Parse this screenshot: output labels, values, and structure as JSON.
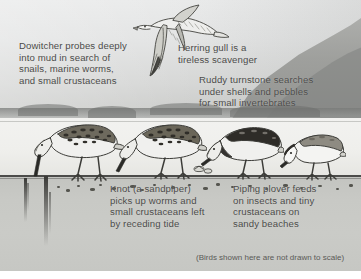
{
  "illustration": {
    "title": "Shorebird feeding behaviors on a tidal beach",
    "scale_note": "(Birds shown here are not drawn to scale)"
  },
  "captions": {
    "dowitcher": "Dowitcher probes deeply\ninto mud in search of\nsnails, marine worms,\nand small crustaceans",
    "herring_gull": "Herring gull is a\ntireless scavenger",
    "ruddy_turnstone": "Ruddy turnstone searches\nunder shells and pebbles\nfor small invertebrates",
    "knot": "Knot (a sandpiper)\npicks up worms and\nsmall crustaceans left\nby receding tide",
    "piping_plover": "Piping plover feeds\non insects and tiny\ncrustaceans on\nsandy beaches"
  },
  "birds": [
    {
      "name": "herring-gull",
      "label": "Herring gull",
      "pose": "flying"
    },
    {
      "name": "dowitcher",
      "label": "Dowitcher",
      "pose": "probing-mud"
    },
    {
      "name": "knot",
      "label": "Knot (a sandpiper)",
      "pose": "picking"
    },
    {
      "name": "ruddy-turnstone",
      "label": "Ruddy turnstone",
      "pose": "turning-shells"
    },
    {
      "name": "piping-plover",
      "label": "Piping plover",
      "pose": "pecking"
    }
  ],
  "colors": {
    "sky": "#e6e7e7",
    "water": "#f1f1ef",
    "beach": "#c8c9c5",
    "ink": "#3a3a37",
    "text": "#4a4a48"
  }
}
